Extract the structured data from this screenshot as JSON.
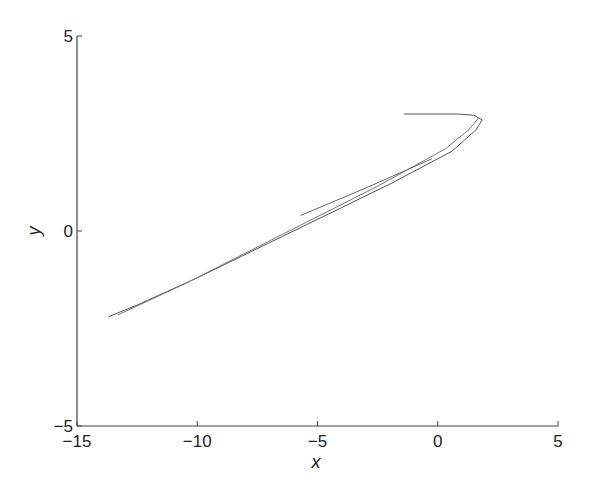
{
  "chart_data": {
    "type": "line",
    "title": "",
    "xlabel": "x",
    "ylabel": "y",
    "xlim": [
      -15,
      5
    ],
    "ylim": [
      -5,
      5
    ],
    "xticks": [
      -15,
      -10,
      -5,
      0,
      5
    ],
    "yticks": [
      -5,
      0,
      5
    ],
    "xtick_labels": [
      "−15",
      "−10",
      "−5",
      "0",
      "5"
    ],
    "ytick_labels": [
      "−5",
      "0",
      "5"
    ],
    "grid": false,
    "legend": null,
    "series": [
      {
        "name": "trajectory-main",
        "color": "#555555",
        "points": [
          [
            -1.4,
            3.0
          ],
          [
            0.8,
            3.0
          ],
          [
            1.5,
            2.97
          ],
          [
            1.85,
            2.85
          ],
          [
            1.6,
            2.6
          ],
          [
            0.6,
            2.05
          ],
          [
            -2.0,
            1.2
          ],
          [
            -6.0,
            0.0
          ],
          [
            -10.0,
            -1.2
          ],
          [
            -12.5,
            -1.9
          ],
          [
            -13.7,
            -2.2
          ]
        ]
      },
      {
        "name": "trajectory-inner",
        "color": "#777777",
        "points": [
          [
            1.7,
            2.9
          ],
          [
            1.3,
            2.6
          ],
          [
            0.3,
            2.1
          ],
          [
            -2.5,
            1.15
          ],
          [
            -6.5,
            -0.1
          ],
          [
            -10.5,
            -1.35
          ],
          [
            -13.3,
            -2.15
          ]
        ]
      },
      {
        "name": "trajectory-branch-upper",
        "color": "#666666",
        "points": [
          [
            -5.7,
            0.4
          ],
          [
            -3.0,
            1.1
          ],
          [
            -0.25,
            1.85
          ]
        ]
      }
    ]
  }
}
